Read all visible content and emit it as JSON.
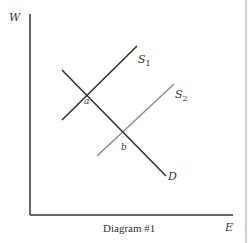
{
  "diagram": {
    "caption": "Diagram #1",
    "axes": {
      "y_label": "W",
      "x_label": "E"
    },
    "curves": [
      {
        "name": "S1",
        "label_main": "S",
        "label_sub": "1",
        "color": "#333333",
        "from": [
          62,
          120
        ],
        "to": [
          137,
          46
        ]
      },
      {
        "name": "S2",
        "label_main": "S",
        "label_sub": "2",
        "color": "#8a8a8a",
        "from": [
          97,
          156
        ],
        "to": [
          174,
          84
        ]
      },
      {
        "name": "D",
        "label_main": "D",
        "color": "#333333",
        "from": [
          62,
          70
        ],
        "to": [
          166,
          176
        ]
      }
    ],
    "points": [
      {
        "label": "a"
      },
      {
        "label": "b"
      }
    ],
    "colors": {
      "axis": "#333333",
      "border": "#999999"
    }
  }
}
